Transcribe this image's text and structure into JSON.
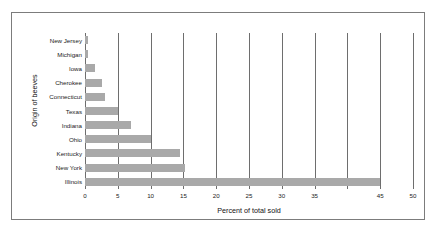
{
  "chart_data": {
    "type": "bar",
    "orientation": "horizontal",
    "title": "",
    "xlabel": "Percent of total sold",
    "ylabel": "Origin of beeves",
    "categories": [
      "New Jersey",
      "Michigan",
      "Iowa",
      "Cherokee",
      "Connecticut",
      "Texas",
      "Indiana",
      "Ohio",
      "Kentucky",
      "New York",
      "Illinois"
    ],
    "values": [
      0.4,
      0.5,
      1.6,
      2.6,
      3.0,
      5.0,
      7.0,
      10.0,
      14.5,
      15.3,
      45.0
    ],
    "xlim": [
      0,
      50
    ],
    "ylim": [
      0,
      11
    ],
    "xticks": [
      0,
      5,
      10,
      15,
      20,
      25,
      30,
      35,
      40,
      45,
      50
    ],
    "xtick_labels": [
      "0",
      "5",
      "10",
      "15",
      "20",
      "25",
      "30",
      "35",
      "",
      "45",
      "50"
    ],
    "grid": true,
    "grid_axis": "x",
    "legend": false,
    "legend_position": "none",
    "bar_color": "#a9a9a9",
    "gridline_color": "#6e6e6e",
    "border_color": "#7c7c7c",
    "background_color": "#ffffff",
    "text_color": "#1b1b1b"
  }
}
